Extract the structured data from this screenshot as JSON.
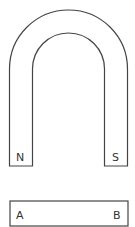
{
  "diagram": {
    "magnet": {
      "type": "horseshoe",
      "left_pole_label": "N",
      "right_pole_label": "S"
    },
    "bar": {
      "left_label": "A",
      "right_label": "B"
    },
    "colors": {
      "stroke": "#444444",
      "background": "#ffffff"
    }
  }
}
